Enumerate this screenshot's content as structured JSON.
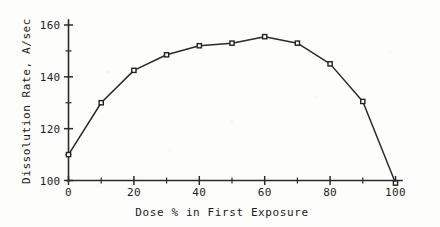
{
  "chart_data": {
    "type": "line",
    "title": "",
    "xlabel": "Dose % in First Exposure",
    "ylabel": "Dissolution Rate, A/sec",
    "x": [
      0,
      10,
      20,
      30,
      40,
      50,
      60,
      70,
      80,
      90,
      100
    ],
    "values": [
      110,
      130,
      142.5,
      148.5,
      152,
      153,
      155.5,
      153,
      145,
      130.5,
      99
    ],
    "series": [
      {
        "name": "Dissolution Rate",
        "values": [
          110,
          130,
          142.5,
          148.5,
          152,
          153,
          155.5,
          153,
          145,
          130.5,
          99
        ]
      }
    ],
    "xlim": [
      0,
      100
    ],
    "ylim": [
      100,
      164
    ],
    "x_ticks_major": [
      0,
      20,
      40,
      60,
      80,
      100
    ],
    "x_ticks_minor": [
      10,
      30,
      50,
      70,
      90
    ],
    "x_tick_labels": [
      "0",
      "20",
      "40",
      "60",
      "80",
      "100"
    ],
    "y_ticks_major": [
      100,
      120,
      140,
      160
    ],
    "y_ticks_minor": [
      110,
      130,
      150
    ],
    "y_tick_labels": [
      "100",
      "120",
      "140",
      "160"
    ],
    "grid": false,
    "legend": "none",
    "marker": "open-square",
    "line_color": "#2a2a2a",
    "marker_fill": "#ffffff",
    "marker_edge": "#222222",
    "background": "#fdfdfc"
  }
}
